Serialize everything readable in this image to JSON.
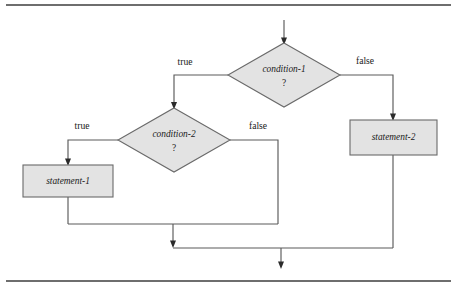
{
  "figure": {
    "kind": "flowchart",
    "background_color": "#ffffff",
    "rule_color": "#6e6e6e",
    "line_color": "#5a5a5a",
    "node_fill_color": "#e3e3e3",
    "node_stroke_color": "#6a6a6a",
    "text_color": "#1a1a1a"
  },
  "rules": {
    "top_rule_y": 5,
    "bottom_rule_y": 281
  },
  "nodes": {
    "decision_1": {
      "type": "decision",
      "label": "condition-1",
      "sublabel": "?",
      "cx": 284,
      "cy": 75,
      "rx": 56,
      "ry": 32
    },
    "decision_2": {
      "type": "decision",
      "label": "condition-2",
      "sublabel": "?",
      "cx": 174,
      "cy": 140,
      "rx": 56,
      "ry": 32
    },
    "process_1": {
      "type": "process",
      "label": "statement-1",
      "x": 23,
      "y": 165,
      "w": 90,
      "h": 32
    },
    "process_2": {
      "type": "process",
      "label": "statement-2",
      "x": 350,
      "y": 120,
      "w": 87,
      "h": 35
    }
  },
  "edge_labels": {
    "d1_true": "true",
    "d1_false": "false",
    "d2_true": "true",
    "d2_false": "false"
  },
  "edge_label_positions": {
    "d1_true": {
      "x": 185,
      "y": 63
    },
    "d1_false": {
      "x": 365,
      "y": 62
    },
    "d2_true": {
      "x": 82,
      "y": 127
    },
    "d2_false": {
      "x": 258,
      "y": 127
    }
  },
  "geometry": {
    "entry_arrow": {
      "x": 284,
      "y_start": 20,
      "y_end": 43
    },
    "d1_true_path": "M 228 75 L 174 75 L 174 108",
    "d1_false_path": "M 340 75 L 393 75 L 393 120",
    "d2_true_path": "M 118 140 L 68 140 L 68 165",
    "d2_false_path": "M 230 140 L 278 140 L 278 224",
    "p1_exit_path": "M 68 197 L 68 224",
    "merge_line_1": "M 68 224 L 278 224",
    "merge_drop_1": "M 173 224 L 173 247",
    "merge_line_2": "M 173 248 L 393 248",
    "p2_exit_path": "M 393 155 L 393 248",
    "exit_arrow": {
      "x": 281,
      "y_start": 248,
      "y_end": 268
    }
  }
}
